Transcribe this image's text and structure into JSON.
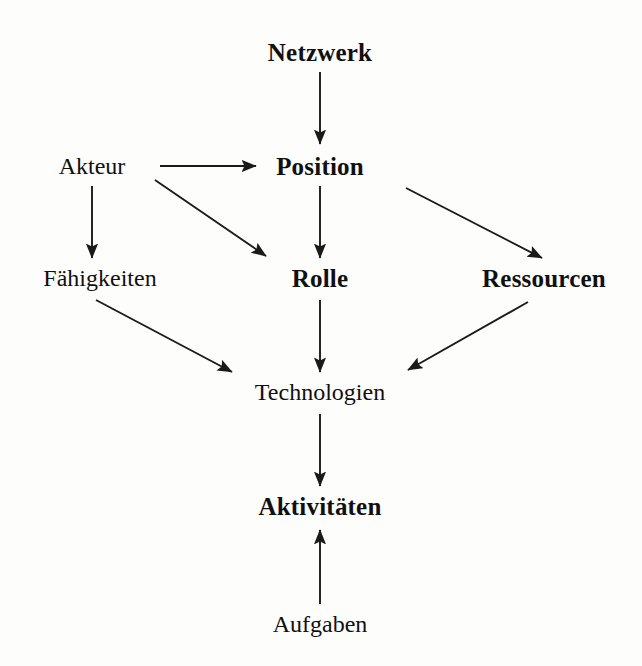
{
  "diagram": {
    "background_color": "#fdfdfc",
    "line_color": "#1a1a1a",
    "text_color": "#101010",
    "nodes": [
      {
        "id": "netzwerk",
        "label": "Netzwerk",
        "weight": "bold",
        "x": 320,
        "y": 52,
        "font_size": 25
      },
      {
        "id": "akteur",
        "label": "Akteur",
        "weight": "regular",
        "x": 92,
        "y": 166,
        "font_size": 24
      },
      {
        "id": "position",
        "label": "Position",
        "weight": "bold",
        "x": 320,
        "y": 166,
        "font_size": 25
      },
      {
        "id": "faehigkeiten",
        "label": "Fähigkeiten",
        "weight": "regular",
        "x": 100,
        "y": 278,
        "font_size": 24
      },
      {
        "id": "rolle",
        "label": "Rolle",
        "weight": "bold",
        "x": 320,
        "y": 278,
        "font_size": 25
      },
      {
        "id": "ressourcen",
        "label": "Ressourcen",
        "weight": "bold",
        "x": 544,
        "y": 278,
        "font_size": 25
      },
      {
        "id": "technologien",
        "label": "Technologien",
        "weight": "regular",
        "x": 320,
        "y": 392,
        "font_size": 24
      },
      {
        "id": "aktivitaeten",
        "label": "Aktivitäten",
        "weight": "bold",
        "x": 320,
        "y": 506,
        "font_size": 25
      },
      {
        "id": "aufgaben",
        "label": "Aufgaben",
        "weight": "regular",
        "x": 320,
        "y": 624,
        "font_size": 24
      }
    ],
    "edges": [
      {
        "id": "netzwerk-position",
        "from": "netzwerk",
        "to": "position",
        "x1": 320,
        "y1": 72,
        "x2": 320,
        "y2": 144,
        "direction": "down"
      },
      {
        "id": "akteur-position",
        "from": "akteur",
        "to": "position",
        "x1": 160,
        "y1": 166,
        "x2": 256,
        "y2": 166,
        "direction": "right"
      },
      {
        "id": "akteur-faehigkeiten",
        "from": "akteur",
        "to": "faehigkeiten",
        "x1": 92,
        "y1": 186,
        "x2": 92,
        "y2": 258,
        "direction": "down"
      },
      {
        "id": "akteur-rolle",
        "from": "akteur",
        "to": "rolle",
        "x1": 155,
        "y1": 180,
        "x2": 266,
        "y2": 256,
        "direction": "diagonal-down-right"
      },
      {
        "id": "position-rolle",
        "from": "position",
        "to": "rolle",
        "x1": 320,
        "y1": 186,
        "x2": 320,
        "y2": 258,
        "direction": "down"
      },
      {
        "id": "position-ressourcen",
        "from": "position",
        "to": "ressourcen",
        "x1": 406,
        "y1": 188,
        "x2": 542,
        "y2": 258,
        "direction": "diagonal-down-right"
      },
      {
        "id": "faehigkeiten-technologien",
        "from": "faehigkeiten",
        "to": "technologien",
        "x1": 96,
        "y1": 300,
        "x2": 232,
        "y2": 372,
        "direction": "diagonal-down-right"
      },
      {
        "id": "rolle-technologien",
        "from": "rolle",
        "to": "technologien",
        "x1": 320,
        "y1": 300,
        "x2": 320,
        "y2": 372,
        "direction": "down"
      },
      {
        "id": "ressourcen-technologien",
        "from": "ressourcen",
        "to": "technologien",
        "x1": 528,
        "y1": 302,
        "x2": 408,
        "y2": 370,
        "direction": "diagonal-down-left"
      },
      {
        "id": "technologien-aktivitaeten",
        "from": "technologien",
        "to": "aktivitaeten",
        "x1": 320,
        "y1": 414,
        "x2": 320,
        "y2": 486,
        "direction": "down"
      },
      {
        "id": "aufgaben-aktivitaeten",
        "from": "aufgaben",
        "to": "aktivitaeten",
        "x1": 320,
        "y1": 604,
        "x2": 320,
        "y2": 530,
        "direction": "up"
      }
    ]
  }
}
